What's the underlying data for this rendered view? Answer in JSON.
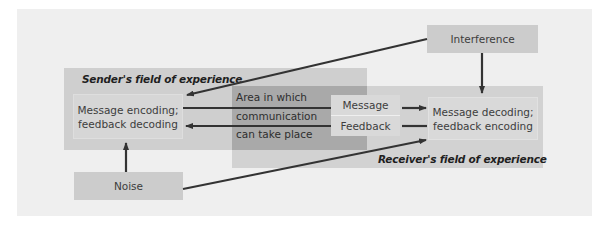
{
  "diagram": {
    "sender_field": {
      "label": "Sender's field of experience"
    },
    "receiver_field": {
      "label": "Receiver's field of experience"
    },
    "overlap_area": {
      "lines": [
        "Area in which",
        "communication",
        "can take place"
      ]
    },
    "nodes": {
      "interference": "Interference",
      "noise": "Noise",
      "sender_box": {
        "line1": "Message encoding;",
        "line2": "feedback decoding"
      },
      "receiver_box": {
        "line1": "Message decoding;",
        "line2": "feedback encoding"
      },
      "message": "Message",
      "feedback": "Feedback"
    },
    "edges": [
      {
        "from": "Interference",
        "to": "Sender box"
      },
      {
        "from": "Interference",
        "to": "Receiver box"
      },
      {
        "from": "Noise",
        "to": "Sender box"
      },
      {
        "from": "Noise",
        "to": "Receiver box"
      },
      {
        "from": "Sender box",
        "to": "Receiver box",
        "label": "Message"
      },
      {
        "from": "Receiver box",
        "to": "Sender box",
        "label": "Feedback"
      }
    ],
    "colors": {
      "panel": "#efefef",
      "field": "#cfcfcf",
      "overlap": "#a9a9a9",
      "box": "#cccccc",
      "arrow": "#333333"
    }
  }
}
